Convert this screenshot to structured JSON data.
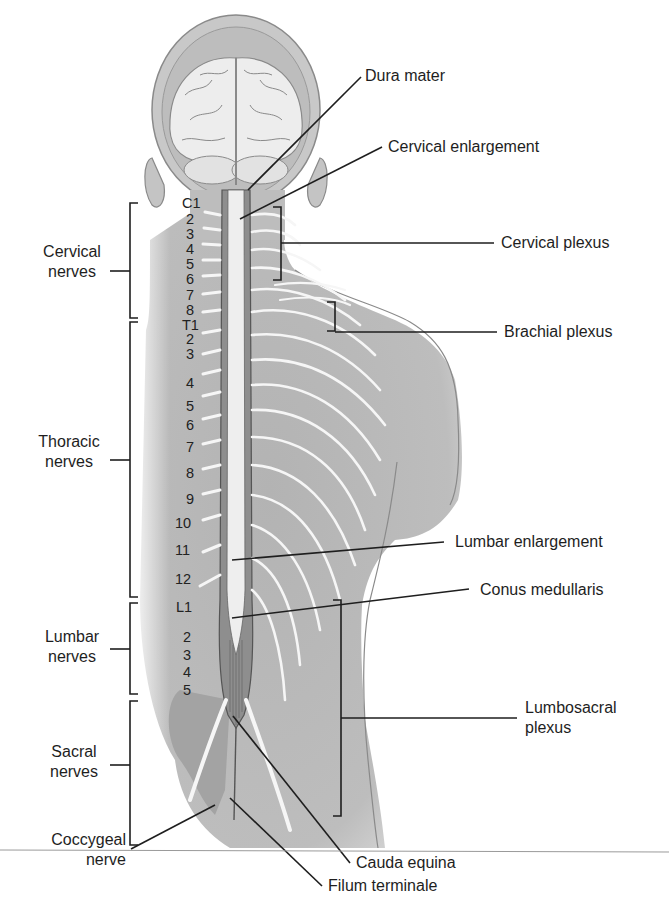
{
  "figure": {
    "type": "anatomical-diagram",
    "left_labels": {
      "cervical": [
        "Cervical",
        "nerves"
      ],
      "thoracic": [
        "Thoracic",
        "nerves"
      ],
      "lumbar": [
        "Lumbar",
        "nerves"
      ],
      "sacral": [
        "Sacral",
        "nerves"
      ],
      "coccygeal": [
        "Coccygeal",
        "nerve"
      ]
    },
    "right_labels": {
      "dura_mater": "Dura mater",
      "cervical_enlargement": "Cervical enlargement",
      "cervical_plexus": "Cervical plexus",
      "brachial_plexus": "Brachial plexus",
      "lumbar_enlargement": "Lumbar enlargement",
      "conus_medullaris": "Conus medullaris",
      "lumbosacral_plexus": [
        "Lumbosacral",
        "plexus"
      ],
      "cauda_equina": "Cauda equina",
      "filum_terminale": "Filum terminale"
    },
    "segments": {
      "cervical": [
        "C1",
        "2",
        "3",
        "4",
        "5",
        "6",
        "7",
        "8"
      ],
      "thoracic": [
        "T1",
        "2",
        "3",
        "4",
        "5",
        "6",
        "7",
        "8",
        "9",
        "10",
        "11",
        "12"
      ],
      "lumbar": [
        "L1",
        "2",
        "3",
        "4",
        "5"
      ]
    },
    "colors": {
      "skin": "#b9b9b9",
      "skin_dark": "#a6a6a6",
      "nerve": "#f4f4f4",
      "leader_line": "#1e1e1e",
      "brain": "#ececec"
    }
  }
}
